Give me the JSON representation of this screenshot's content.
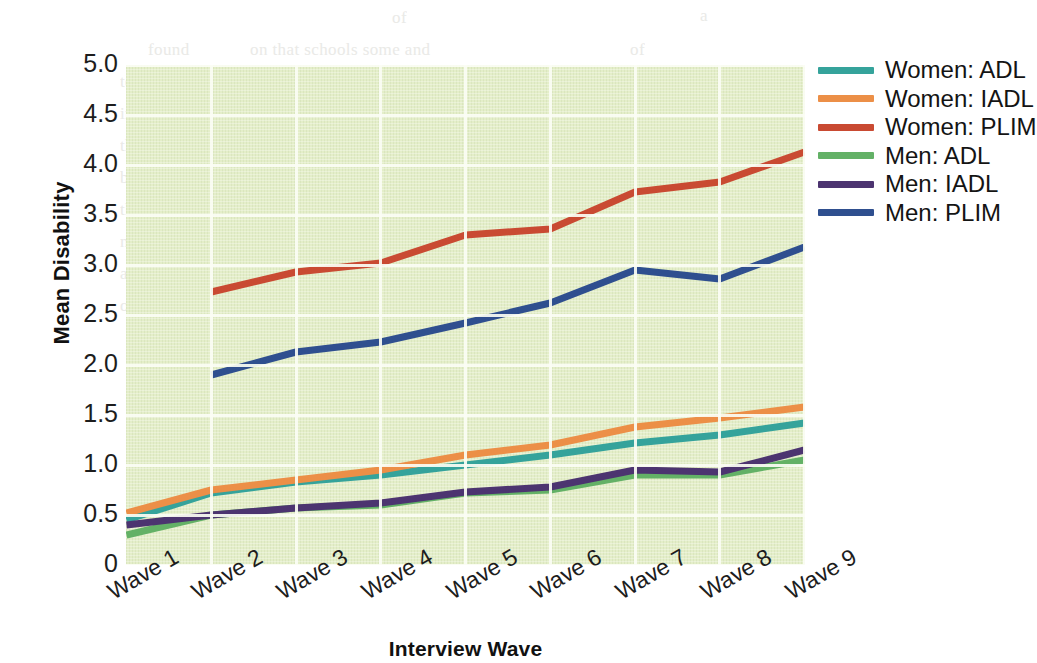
{
  "chart_data": {
    "type": "line",
    "title": "",
    "xlabel": "Interview Wave",
    "ylabel": "Mean Disability",
    "categories": [
      "Wave 1",
      "Wave 2",
      "Wave 3",
      "Wave 4",
      "Wave 5",
      "Wave 6",
      "Wave 7",
      "Wave 8",
      "Wave 9"
    ],
    "ylim": [
      0,
      5.0
    ],
    "yticks": [
      "0",
      "0.5",
      "1.0",
      "1.5",
      "2.0",
      "2.5",
      "3.0",
      "3.5",
      "4.0",
      "4.5",
      "5.0"
    ],
    "ytick_values": [
      0,
      0.5,
      1.0,
      1.5,
      2.0,
      2.5,
      3.0,
      3.5,
      4.0,
      4.5,
      5.0
    ],
    "grid": true,
    "grid_color": "#fbfdf4",
    "plot_background": "#e4eec9",
    "legend_position": "right",
    "series": [
      {
        "name": "Women: ADL",
        "color": "#35a39b",
        "values": [
          0.45,
          0.72,
          0.83,
          0.9,
          1.0,
          1.1,
          1.22,
          1.3,
          1.42
        ]
      },
      {
        "name": "Women: IADL",
        "color": "#ec8f47",
        "values": [
          0.52,
          0.75,
          0.85,
          0.95,
          1.1,
          1.2,
          1.38,
          1.47,
          1.58
        ]
      },
      {
        "name": "Women: PLIM",
        "color": "#c94a32",
        "values": [
          null,
          2.73,
          2.93,
          3.02,
          3.3,
          3.36,
          3.73,
          3.83,
          4.13
        ]
      },
      {
        "name": "Men: ADL",
        "color": "#63b166",
        "values": [
          0.3,
          0.5,
          0.57,
          0.6,
          0.72,
          0.75,
          0.9,
          0.9,
          1.05
        ]
      },
      {
        "name": "Men: IADL",
        "color": "#4c3470",
        "values": [
          0.4,
          0.5,
          0.57,
          0.62,
          0.73,
          0.78,
          0.95,
          0.93,
          1.15
        ]
      },
      {
        "name": "Men: PLIM",
        "color": "#2f4f8f",
        "values": [
          null,
          1.9,
          2.13,
          2.23,
          2.42,
          2.62,
          2.95,
          2.86,
          3.18
        ]
      }
    ]
  },
  "bleed_text": {
    "lines": [
      {
        "x": 392,
        "y": 8,
        "text": "of",
        "size": 17
      },
      {
        "x": 700,
        "y": 6,
        "text": "a",
        "size": 17
      },
      {
        "x": 148,
        "y": 40,
        "text": "found",
        "size": 17
      },
      {
        "x": 250,
        "y": 40,
        "text": "on that schools some and",
        "size": 17
      },
      {
        "x": 630,
        "y": 40,
        "text": "of",
        "size": 17
      },
      {
        "x": 120,
        "y": 72,
        "text": "to a degree.",
        "size": 17
      },
      {
        "x": 300,
        "y": 72,
        "text": "emerge. The UNESCO, for example, and",
        "size": 17
      },
      {
        "x": 120,
        "y": 104,
        "text": "in results",
        "size": 17
      },
      {
        "x": 290,
        "y": 104,
        "text": "in the educational area, and the",
        "size": 17
      },
      {
        "x": 120,
        "y": 136,
        "text": "this Wa",
        "size": 17
      },
      {
        "x": 270,
        "y": 136,
        "text": "that England et al. 2016 of Europe (Nord, and",
        "size": 17
      },
      {
        "x": 120,
        "y": 168,
        "text": "blocks at",
        "size": 17
      },
      {
        "x": 290,
        "y": 168,
        "text": "the Some, 2012). An unusual difference is",
        "size": 17
      },
      {
        "x": 120,
        "y": 200,
        "text": "the AHC and",
        "size": 17
      },
      {
        "x": 340,
        "y": 200,
        "text": "presence of the has, see the",
        "size": 17
      },
      {
        "x": 120,
        "y": 232,
        "text": "may read to any",
        "size": 17
      },
      {
        "x": 330,
        "y": 232,
        "text": "the sources of the or spect for the",
        "size": 17
      },
      {
        "x": 120,
        "y": 264,
        "text": "and each of and is",
        "size": 17
      },
      {
        "x": 120,
        "y": 296,
        "text": "of new Wholds and",
        "size": 17
      },
      {
        "x": 290,
        "y": 330,
        "text": "those some some to us the",
        "size": 17
      },
      {
        "x": 280,
        "y": 362,
        "text": "used years of a reasonable or one who disability",
        "size": 17
      },
      {
        "x": 300,
        "y": 394,
        "text": "and to an increases to that the and it is UN to a",
        "size": 17
      },
      {
        "x": 300,
        "y": 426,
        "text": "some more or more on to show or its terms",
        "size": 17
      },
      {
        "x": 300,
        "y": 458,
        "text": "that we of is and in a of us in the",
        "size": 17
      },
      {
        "x": 300,
        "y": 490,
        "text": "scoot and the on effect.",
        "size": 17
      }
    ]
  }
}
